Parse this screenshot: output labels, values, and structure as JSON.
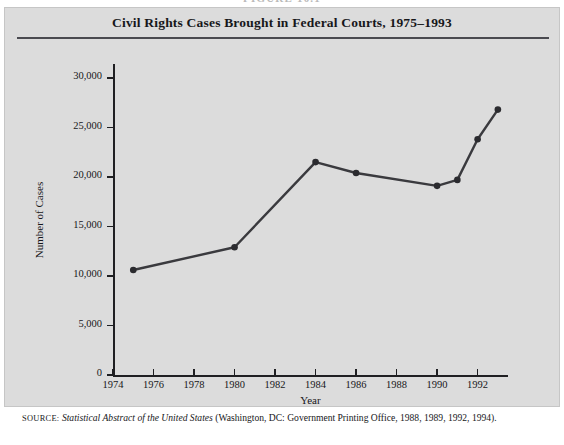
{
  "figure": {
    "number_label": "FIGURE 10.1",
    "title": "Civil Rights Cases Brought in Federal Courts, 1975–1993",
    "source_label": "SOURCE:",
    "source_italic": "Statistical Abstract of the United States",
    "source_rest": " (Washington, DC: Government Printing Office, 1988, 1989, 1992, 1994)."
  },
  "colors": {
    "panel_background": "#dcdcdc",
    "page_background": "#ffffff",
    "ink": "#17171a",
    "axis": "#1f1f22",
    "rule": "#4a4a50",
    "series_line": "#3a3a3e",
    "marker": "#2b2b2f"
  },
  "chart_data": {
    "type": "line",
    "title": "Civil Rights Cases Brought in Federal Courts, 1975–1993",
    "xlabel": "Year",
    "ylabel": "Number of Cases",
    "xlim": [
      1974,
      1993.5
    ],
    "ylim": [
      0,
      31000
    ],
    "grid": false,
    "legend": "none",
    "x_tick_labels": [
      "1974",
      "1976",
      "1978",
      "1980",
      "1982",
      "1984",
      "1986",
      "1988",
      "1990",
      "1992"
    ],
    "x_tick_values": [
      1974,
      1976,
      1978,
      1980,
      1982,
      1984,
      1986,
      1988,
      1990,
      1992
    ],
    "y_tick_labels": [
      "0",
      "5,000",
      "10,000",
      "15,000",
      "20,000",
      "25,000",
      "30,000"
    ],
    "y_tick_values": [
      0,
      5000,
      10000,
      15000,
      20000,
      25000,
      30000
    ],
    "series": [
      {
        "name": "Civil rights cases filed",
        "x": [
          1975,
          1980,
          1984,
          1986,
          1990,
          1991,
          1992,
          1993
        ],
        "values": [
          10600,
          12900,
          21500,
          20400,
          19100,
          19700,
          23800,
          26800
        ]
      }
    ]
  }
}
